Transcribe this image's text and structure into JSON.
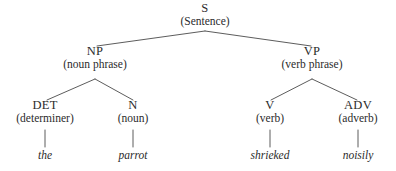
{
  "figure": {
    "background_color": "#ffffff",
    "text_color": "#2b2b2b",
    "line_color": "#4a4a4a"
  },
  "nodes": {
    "s": {
      "symbol": "S",
      "gloss": "(Sentence)"
    },
    "np": {
      "symbol": "NP",
      "gloss": "(noun phrase)"
    },
    "vp": {
      "symbol": "VP",
      "gloss": "(verb phrase)"
    },
    "det": {
      "symbol": "DET",
      "gloss": "(determiner)"
    },
    "n": {
      "symbol": "N",
      "gloss": "(noun)"
    },
    "v": {
      "symbol": "V",
      "gloss": "(verb)"
    },
    "adv": {
      "symbol": "ADV",
      "gloss": "(adverb)"
    }
  },
  "leaves": {
    "det_word": "the",
    "n_word": "parrot",
    "v_word": "shrieked",
    "adv_word": "noisily"
  },
  "sentence": "the parrot shrieked noisily",
  "tree_structure": {
    "label": "S",
    "children": [
      {
        "label": "NP",
        "children": [
          {
            "label": "DET",
            "word": "the"
          },
          {
            "label": "N",
            "word": "parrot"
          }
        ]
      },
      {
        "label": "VP",
        "children": [
          {
            "label": "V",
            "word": "shrieked"
          },
          {
            "label": "ADV",
            "word": "noisily"
          }
        ]
      }
    ]
  }
}
